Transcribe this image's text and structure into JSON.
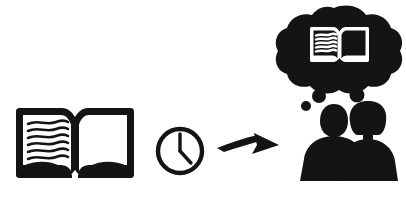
{
  "scene": {
    "title": "Reading comprehension pictogram",
    "description": "An open book, then a clock, then an arrow pointing right to two people sharing a thought cloud containing an open book.",
    "width": 406,
    "height": 204,
    "background_color": "#ffffff",
    "ink_color": "#141414"
  },
  "elements": {
    "book_left": {
      "name": "open book",
      "label": "",
      "page_lines": 7,
      "left_page_content": "wavy text lines",
      "right_page_content": "blank"
    },
    "clock": {
      "name": "clock",
      "label": "",
      "hour_hand_position": "4",
      "minute_hand_position": "12",
      "time_shown": "4:00"
    },
    "arrow": {
      "name": "arrow pointing right",
      "label": "",
      "direction": "right",
      "style": "tapered swoosh"
    },
    "people": {
      "name": "two people",
      "label": "",
      "figures": [
        {
          "name": "person-left",
          "hair": "short"
        },
        {
          "name": "person-right",
          "hair": "bob"
        }
      ]
    },
    "thought_cloud": {
      "name": "thought cloud",
      "label": "",
      "contents": "open book",
      "bubble_dots": 4,
      "book_page_lines": 6
    }
  }
}
